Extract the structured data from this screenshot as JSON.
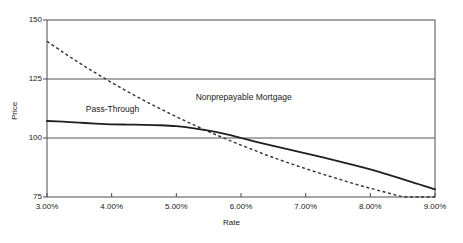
{
  "chart_data": {
    "type": "line",
    "title": "",
    "xlabel": "Rate",
    "ylabel": "Price",
    "xlim": [
      3.0,
      9.0
    ],
    "ylim": [
      75,
      150
    ],
    "grid": true,
    "grid_axis": "y",
    "legend_position": "inline-annotations",
    "x_tick_labels": [
      "3.00%",
      "4.00%",
      "5.00%",
      "6.00%",
      "7.00%",
      "8.00%",
      "9.00%"
    ],
    "x_tick_values": [
      3.0,
      4.0,
      5.0,
      6.0,
      7.0,
      8.0,
      9.0
    ],
    "y_tick_labels": [
      "150",
      "125",
      "100",
      "75"
    ],
    "y_tick_values": [
      150,
      125,
      100,
      75
    ],
    "x": [
      3.0,
      3.25,
      3.5,
      3.75,
      4.0,
      4.25,
      4.5,
      4.75,
      5.0,
      5.25,
      5.5,
      5.75,
      6.0,
      6.25,
      6.5,
      6.75,
      7.0,
      7.25,
      7.5,
      7.75,
      8.0,
      8.25,
      8.5,
      8.75,
      9.0
    ],
    "series": [
      {
        "name": "Nonprepayable Mortgage",
        "style": "dashed",
        "color": "#333333",
        "annotation": "Nonprepayable Mortgage",
        "values": [
          141.0,
          136.3,
          131.8,
          127.6,
          123.5,
          119.6,
          115.9,
          112.4,
          109.0,
          105.8,
          102.7,
          99.8,
          97.0,
          94.3,
          91.7,
          89.3,
          87.0,
          84.8,
          82.7,
          80.6,
          78.7,
          76.9,
          75.2,
          75.0,
          74.8
        ]
      },
      {
        "name": "Pass-Through",
        "style": "solid",
        "color": "#222222",
        "annotation": "Pass-Through",
        "values": [
          107.2,
          106.9,
          106.5,
          106.1,
          105.8,
          105.7,
          105.6,
          105.4,
          105.0,
          104.2,
          103.1,
          101.7,
          100.0,
          98.3,
          96.7,
          95.1,
          93.5,
          91.9,
          90.2,
          88.5,
          86.7,
          84.7,
          82.6,
          80.4,
          78.2
        ]
      }
    ],
    "annotations": [
      {
        "text": "Nonprepayable Mortgage",
        "x": 5.3,
        "y": 117
      },
      {
        "text": "Pass-Through",
        "x": 3.6,
        "y": 112
      }
    ]
  }
}
